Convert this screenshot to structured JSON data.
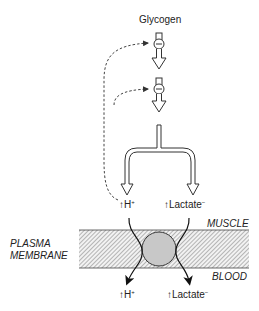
{
  "diagram": {
    "top_label": "Glycogen",
    "muscle_label": "MUSCLE",
    "blood_label": "BLOOD",
    "membrane_label_line1": "PLASMA",
    "membrane_label_line2": "MEMBRANE",
    "upper_h": "H",
    "upper_h_sup": "+",
    "upper_lactate": "Lactate",
    "upper_lactate_sup": "−",
    "lower_h": "H",
    "lower_h_sup": "+",
    "lower_lactate": "Lactate",
    "lower_lactate_sup": "−",
    "up_arrow": "↑",
    "enzyme_symbol": "−",
    "colors": {
      "membrane_fill": "#e6e6e6",
      "transporter": "#c8c8c8",
      "line": "#333333"
    }
  }
}
